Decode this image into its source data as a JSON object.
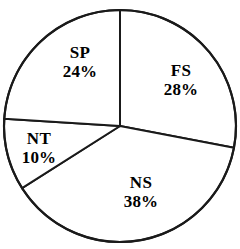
{
  "chart_data": {
    "type": "pie",
    "title": "",
    "subtitle": "",
    "xlabel": "",
    "ylabel": "",
    "legend_position": "none",
    "grid": false,
    "labels_inside_slices": true,
    "start_angle_deg": 0,
    "direction": "clockwise",
    "categories": [
      "FS",
      "NS",
      "NT",
      "SP"
    ],
    "values": [
      28,
      38,
      10,
      24
    ],
    "value_suffix": "%",
    "total": 100,
    "slices": [
      {
        "name": "FS",
        "value": 28,
        "value_label": "28%",
        "start_deg": 0,
        "end_deg": 100.8,
        "label_x": 181,
        "label_y": 80,
        "fill": "#ffffff",
        "stroke": "#1a1a1a"
      },
      {
        "name": "NS",
        "value": 38,
        "value_label": "38%",
        "start_deg": 100.8,
        "end_deg": 237.6,
        "label_x": 141,
        "label_y": 192,
        "fill": "#ffffff",
        "stroke": "#1a1a1a"
      },
      {
        "name": "NT",
        "value": 10,
        "value_label": "10%",
        "start_deg": 237.6,
        "end_deg": 273.6,
        "label_x": 39,
        "label_y": 148,
        "fill": "#ffffff",
        "stroke": "#1a1a1a"
      },
      {
        "name": "SP",
        "value": 24,
        "value_label": "24%",
        "start_deg": 273.6,
        "end_deg": 360,
        "label_x": 80,
        "label_y": 62,
        "fill": "#ffffff",
        "stroke": "#1a1a1a"
      }
    ],
    "geometry": {
      "center_x": 120,
      "center_y": 126,
      "radius": 116
    },
    "colors": {
      "background": "#ffffff",
      "outline": "#1a1a1a",
      "text": "#000000"
    }
  }
}
